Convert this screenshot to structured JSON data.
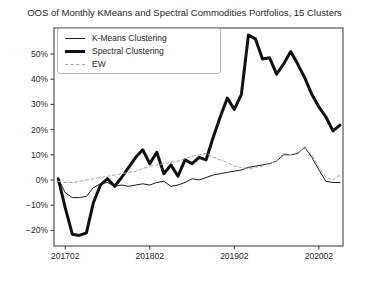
{
  "chart_data": {
    "type": "line",
    "title": "OOS of Monthly KMeans and Spectral Commodities Portfolios, 15 Clusters",
    "x": [
      "201701",
      "201702",
      "201703",
      "201704",
      "201705",
      "201706",
      "201707",
      "201708",
      "201709",
      "201710",
      "201711",
      "201712",
      "201801",
      "201802",
      "201803",
      "201804",
      "201805",
      "201806",
      "201807",
      "201808",
      "201809",
      "201810",
      "201811",
      "201812",
      "201901",
      "201902",
      "201903",
      "201904",
      "201905",
      "201906",
      "201907",
      "201908",
      "201909",
      "201910",
      "201911",
      "201912",
      "202001",
      "202002",
      "202003",
      "202004",
      "202005"
    ],
    "series": [
      {
        "name": "K-Means Clustering",
        "color": "#1a1a1a",
        "width": 1,
        "dash": null,
        "values": [
          0.5,
          -5,
          -7,
          -7,
          -6.5,
          -3,
          -1.5,
          -1,
          -2.5,
          -2,
          -2.5,
          -2,
          -1.5,
          -2,
          -1,
          -0.5,
          -2.5,
          -2,
          -1,
          0.5,
          0,
          1,
          2,
          2.5,
          3,
          3.5,
          4,
          5,
          5.5,
          6,
          6.5,
          7.5,
          10,
          10,
          10.5,
          13,
          9,
          4,
          -0.5,
          -1,
          -1
        ]
      },
      {
        "name": "Spectral Clustering",
        "color": "#111111",
        "width": 3,
        "dash": null,
        "values": [
          0.5,
          -11,
          -21.5,
          -22,
          -21,
          -9,
          -2,
          0.5,
          -2.5,
          1,
          5,
          9,
          12,
          6.5,
          11,
          2.5,
          6,
          1.5,
          8,
          6.5,
          9,
          8,
          17,
          25,
          32.5,
          28,
          34,
          57.5,
          56,
          48,
          48.5,
          42,
          46,
          51,
          46,
          40.5,
          34,
          29,
          25,
          19.5,
          21.8
        ]
      },
      {
        "name": "EW",
        "color": "#a6a6a6",
        "width": 1,
        "dash": "3,2.5",
        "values": [
          -0.5,
          -1,
          -1,
          -0.5,
          0,
          0.5,
          1,
          1.5,
          2,
          2.5,
          3,
          3.5,
          4.5,
          5.5,
          6,
          6.5,
          7,
          7.5,
          8.5,
          9.5,
          10,
          10.5,
          9,
          8,
          7,
          5.5,
          5,
          4.5,
          5,
          5.5,
          6.5,
          7.5,
          10.5,
          10,
          11,
          12.5,
          10,
          5,
          1,
          0,
          2
        ]
      }
    ],
    "yticks": [
      50,
      40,
      30,
      20,
      10,
      0,
      -10,
      -20
    ],
    "ytick_labels": [
      "50%",
      "40%",
      "30%",
      "20%",
      "10%",
      "0%",
      "−10%",
      "−20%"
    ],
    "xtick_indices": [
      1,
      13,
      25,
      37
    ],
    "xtick_labels": [
      "201702",
      "201802",
      "201902",
      "202002"
    ],
    "ylim": [
      -26,
      60.5
    ],
    "grid": false,
    "legend_position": "upper-left",
    "axis_color": "#333333"
  }
}
